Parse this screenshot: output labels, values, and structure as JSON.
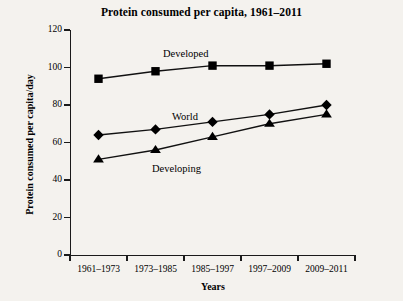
{
  "chart_data": {
    "type": "line",
    "title": "Protein consumed per capita, 1961–2011",
    "xlabel": "Years",
    "ylabel": "Protein consumed per capita/day",
    "categories": [
      "1961–1973",
      "1973–1985",
      "1985–1997",
      "1997–2009",
      "2009–2011"
    ],
    "ylim": [
      0,
      120
    ],
    "yticks": [
      0,
      20,
      40,
      60,
      80,
      100,
      120
    ],
    "grid": false,
    "legend_position": "inline-annotations",
    "series": [
      {
        "name": "Developed",
        "marker": "square",
        "values": [
          94,
          98,
          101,
          101,
          102
        ]
      },
      {
        "name": "World",
        "marker": "diamond",
        "values": [
          64,
          67,
          71,
          75,
          80
        ]
      },
      {
        "name": "Developing",
        "marker": "triangle",
        "values": [
          51,
          56,
          63,
          70,
          75
        ]
      }
    ],
    "annotations": [
      {
        "text": "Developed",
        "series": "Developed"
      },
      {
        "text": "World",
        "series": "World"
      },
      {
        "text": "Developing",
        "series": "Developing"
      }
    ],
    "colors": {
      "line": "#111111",
      "marker": "#000000",
      "axis": "#1a1a1a",
      "background": "#f4f2ee"
    }
  }
}
